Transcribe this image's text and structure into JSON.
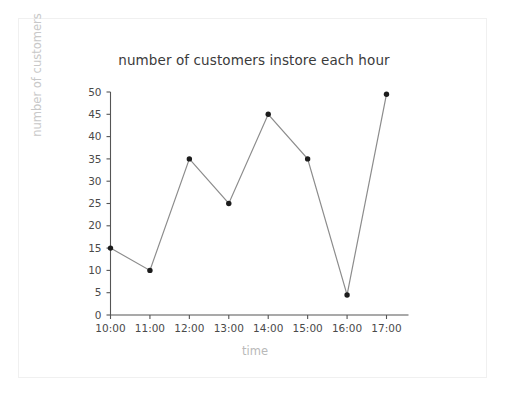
{
  "chart_data": {
    "type": "line",
    "title": "number of customers instore each hour",
    "xlabel": "time",
    "ylabel": "number of customers",
    "categories": [
      "10:00",
      "11:00",
      "12:00",
      "13:00",
      "14:00",
      "15:00",
      "16:00",
      "17:00"
    ],
    "values": [
      15,
      10,
      35,
      25,
      45,
      35,
      4.5,
      49.5
    ],
    "series": [
      {
        "name": "number of customers",
        "values": [
          15,
          10,
          35,
          25,
          45,
          35,
          4.5,
          49.5
        ]
      }
    ],
    "ylim": [
      0,
      50
    ],
    "ytick_labels": [
      "0",
      "5",
      "10",
      "15",
      "20",
      "25",
      "30",
      "35",
      "40",
      "45",
      "50"
    ],
    "ytick_values": [
      0,
      5,
      10,
      15,
      20,
      25,
      30,
      35,
      40,
      45,
      50
    ],
    "xtick_labels": [
      "10:00",
      "11:00",
      "12:00",
      "13:00",
      "14:00",
      "15:00",
      "16:00",
      "17:00"
    ],
    "grid": false,
    "legend": false,
    "marker": "circle",
    "line_color": "#8c8c8c",
    "marker_color": "#1c1c1c",
    "axis_color": "#555555",
    "title_color": "#3b3b3b",
    "axis_label_color": "#c0c0c0",
    "background_color": "#ffffff",
    "frame_color": "#f0f0f0"
  }
}
